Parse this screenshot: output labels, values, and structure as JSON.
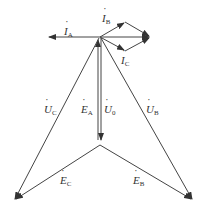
{
  "diagram": {
    "type": "phasor-diagram",
    "colors": {
      "line": "#333333",
      "background": "#ffffff"
    },
    "points": {
      "origin": [
        100,
        37
      ],
      "neutral": [
        100,
        144
      ],
      "tip_c": [
        14,
        200
      ],
      "tip_b": [
        193,
        200
      ],
      "ia_tip": [
        48,
        37
      ],
      "ib_tip": [
        125,
        22
      ],
      "ic_tip": [
        125,
        51
      ],
      "ibc_sum": [
        150,
        37
      ]
    },
    "labels": {
      "ia": {
        "main": "I",
        "sub": "A"
      },
      "ib": {
        "main": "I",
        "sub": "B"
      },
      "ic": {
        "main": "I",
        "sub": "C"
      },
      "uc": {
        "main": "U",
        "sub": "C"
      },
      "ea": {
        "main": "E",
        "sub": "A"
      },
      "u0": {
        "main": "U",
        "sub": "0"
      },
      "ub": {
        "main": "U",
        "sub": "B"
      },
      "ec": {
        "main": "E",
        "sub": "C"
      },
      "eb": {
        "main": "E",
        "sub": "B"
      }
    }
  }
}
